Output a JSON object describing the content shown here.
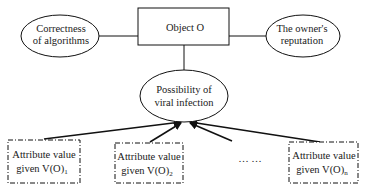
{
  "diagram": {
    "nodes": {
      "object": {
        "label": "Object O",
        "shape": "rectangle"
      },
      "correctness": {
        "line1": "Correctness",
        "line2": "of algorithms",
        "shape": "ellipse"
      },
      "reputation": {
        "line1": "The owner's",
        "line2": "reputation",
        "shape": "ellipse"
      },
      "infection": {
        "line1": "Possibility of",
        "line2": "viral infection",
        "shape": "ellipse"
      },
      "attr1": {
        "line1": "Attribute value",
        "line2": "given V(O)",
        "sub": "1",
        "shape": "dash-dot-rectangle"
      },
      "attr2": {
        "line1": "Attribute value",
        "line2": "given V(O)",
        "sub": "2",
        "shape": "dash-dot-rectangle"
      },
      "attrn": {
        "line1": "Attribute value",
        "line2": "given V(O)",
        "sub": "n",
        "shape": "dash-dot-rectangle"
      }
    },
    "ellipsis": "… …",
    "edges": [
      {
        "from": "correctness",
        "to": "object",
        "type": "line"
      },
      {
        "from": "object",
        "to": "reputation",
        "type": "line"
      },
      {
        "from": "object",
        "to": "infection",
        "type": "line"
      },
      {
        "from": "attr1",
        "to": "infection",
        "type": "arrow"
      },
      {
        "from": "attr2",
        "to": "infection",
        "type": "arrow"
      },
      {
        "from": "ellipsis",
        "to": "infection",
        "type": "arrow"
      },
      {
        "from": "attrn",
        "to": "infection",
        "type": "arrow"
      }
    ],
    "colors": {
      "stroke": "#111111",
      "background": "#ffffff",
      "text": "#1a1a1a"
    }
  }
}
